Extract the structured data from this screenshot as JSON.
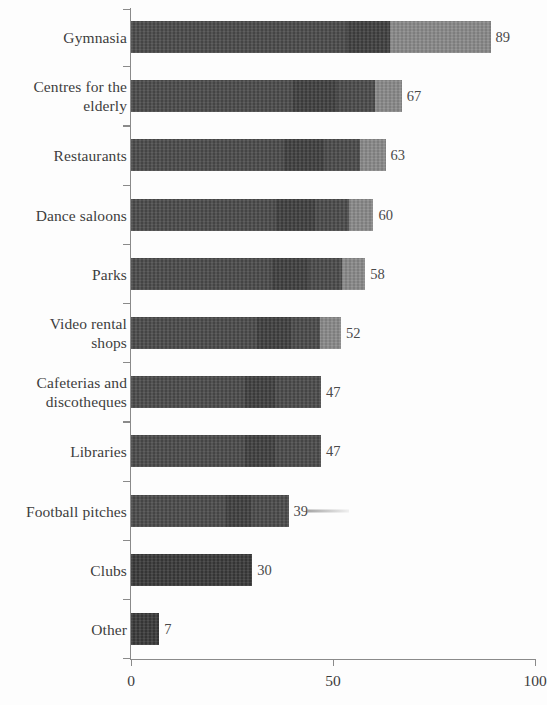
{
  "chart_data": {
    "type": "bar",
    "orientation": "horizontal",
    "title": "",
    "subtitle": "",
    "xlabel": "",
    "ylabel": "",
    "xlim": [
      0,
      100
    ],
    "xticks": [
      "0",
      "50",
      "100"
    ],
    "xtick_values": [
      0,
      50,
      100
    ],
    "grid": false,
    "legend": null,
    "categories": [
      "Gymnasia",
      "Centres for the elderly",
      "Restaurants",
      "Dance saloons",
      "Parks",
      "Video rental shops",
      "Cafeterias and discotheques",
      "Libraries",
      "Football pitches",
      "Clubs",
      "Other"
    ],
    "values": [
      89,
      67,
      63,
      60,
      58,
      52,
      47,
      47,
      39,
      30,
      7
    ],
    "value_labels": [
      "89",
      "67",
      "63",
      "60",
      "58",
      "52",
      "47",
      "47",
      "39",
      "30",
      "7"
    ]
  },
  "axis": {
    "x_tick_labels": [
      "0",
      "50",
      "100"
    ],
    "axis_color": "#8a8a8a"
  },
  "rows": [
    {
      "label": "Gymnasia",
      "label_lines": "Gymnasia",
      "value": 89,
      "value_label": "89"
    },
    {
      "label": "Centres for the elderly",
      "label_lines": "Centres for the\nelderly",
      "value": 67,
      "value_label": "67"
    },
    {
      "label": "Restaurants",
      "label_lines": "Restaurants",
      "value": 63,
      "value_label": "63"
    },
    {
      "label": "Dance saloons",
      "label_lines": "Dance saloons",
      "value": 60,
      "value_label": "60"
    },
    {
      "label": "Parks",
      "label_lines": "Parks",
      "value": 58,
      "value_label": "58"
    },
    {
      "label": "Video rental shops",
      "label_lines": "Video rental\nshops",
      "value": 52,
      "value_label": "52"
    },
    {
      "label": "Cafeterias and discotheques",
      "label_lines": "Cafeterias and\ndiscotheques",
      "value": 47,
      "value_label": "47"
    },
    {
      "label": "Libraries",
      "label_lines": "Libraries",
      "value": 47,
      "value_label": "47"
    },
    {
      "label": "Football pitches",
      "label_lines": "Football pitches",
      "value": 39,
      "value_label": "39"
    },
    {
      "label": "Clubs",
      "label_lines": "Clubs",
      "value": 30,
      "value_label": "30"
    },
    {
      "label": "Other",
      "label_lines": "Other",
      "value": 7,
      "value_label": "7"
    }
  ],
  "colors": {
    "bar_dark": "#4b4b4b",
    "bar_darker": "#3a3a3a",
    "bar_light": "#8a8a8a",
    "axis": "#8a8a8a",
    "text": "#3d3d3d",
    "background": "#fdfdfd"
  }
}
